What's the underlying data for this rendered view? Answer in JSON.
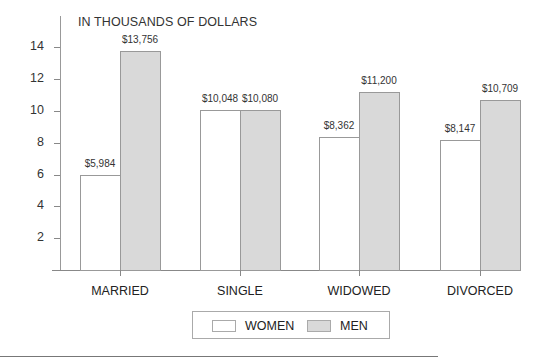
{
  "chart_data": {
    "type": "bar",
    "title": "IN THOUSANDS OF DOLLARS",
    "xlabel": "",
    "ylabel": "",
    "ylim": [
      0,
      15
    ],
    "yticks": [
      2,
      4,
      6,
      8,
      10,
      12,
      14
    ],
    "categories": [
      "MARRIED",
      "SINGLE",
      "WIDOWED",
      "DIVORCED"
    ],
    "series": [
      {
        "name": "WOMEN",
        "values": [
          5.984,
          10.048,
          8.362,
          8.147
        ],
        "labels": [
          "$5,984",
          "$10,048",
          "$8,362",
          "$8,147"
        ],
        "color": "#ffffff"
      },
      {
        "name": "MEN",
        "values": [
          13.756,
          10.08,
          11.2,
          10.709
        ],
        "labels": [
          "$13,756",
          "$10,080",
          "$11,200",
          "$10,709"
        ],
        "color": "#d9d9d9"
      }
    ],
    "grid": false,
    "legend_position": "bottom"
  },
  "ylabels": [
    "14",
    "12",
    "10",
    "8",
    "6",
    "4",
    "2"
  ],
  "legend": {
    "women": "WOMEN",
    "men": "MEN"
  }
}
